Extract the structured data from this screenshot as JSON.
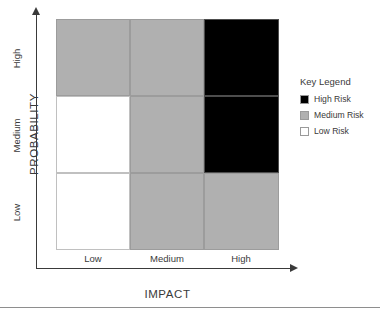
{
  "chart_data": {
    "type": "heatmap",
    "title": "",
    "xlabel": "IMPACT",
    "ylabel": "PROBABILITY",
    "x_categories": [
      "Low",
      "Medium",
      "High"
    ],
    "y_categories": [
      "High",
      "Medium",
      "Low"
    ],
    "grid": true,
    "legend_position": "right",
    "cells": [
      [
        {
          "row": "High",
          "col": "Low",
          "risk": "Medium Risk",
          "color": "#b0b0b0"
        },
        {
          "row": "High",
          "col": "Medium",
          "risk": "Medium Risk",
          "color": "#b0b0b0"
        },
        {
          "row": "High",
          "col": "High",
          "risk": "High Risk",
          "color": "#000000"
        }
      ],
      [
        {
          "row": "Medium",
          "col": "Low",
          "risk": "Low Risk",
          "color": "#ffffff"
        },
        {
          "row": "Medium",
          "col": "Medium",
          "risk": "Medium Risk",
          "color": "#b0b0b0"
        },
        {
          "row": "Medium",
          "col": "High",
          "risk": "High Risk",
          "color": "#000000"
        }
      ],
      [
        {
          "row": "Low",
          "col": "Low",
          "risk": "Low Risk",
          "color": "#ffffff"
        },
        {
          "row": "Low",
          "col": "Medium",
          "risk": "Medium Risk",
          "color": "#b0b0b0"
        },
        {
          "row": "Low",
          "col": "High",
          "risk": "Medium Risk",
          "color": "#b0b0b0"
        }
      ]
    ],
    "legend": {
      "title": "Key Legend",
      "entries": [
        {
          "label": "High Risk",
          "color": "#000000"
        },
        {
          "label": "Medium Risk",
          "color": "#b0b0b0"
        },
        {
          "label": "Low Risk",
          "color": "#ffffff"
        }
      ]
    }
  },
  "axes": {
    "y_title": "PROBABILITY",
    "x_title": "IMPACT",
    "y_ticks": [
      "High",
      "Medium",
      "Low"
    ],
    "x_ticks": [
      "Low",
      "Medium",
      "High"
    ]
  },
  "legend": {
    "title": "Key Legend",
    "items": [
      {
        "label": "High Risk",
        "color": "#000000"
      },
      {
        "label": "Medium Risk",
        "color": "#b0b0b0"
      },
      {
        "label": "Low Risk",
        "color": "#ffffff"
      }
    ]
  }
}
